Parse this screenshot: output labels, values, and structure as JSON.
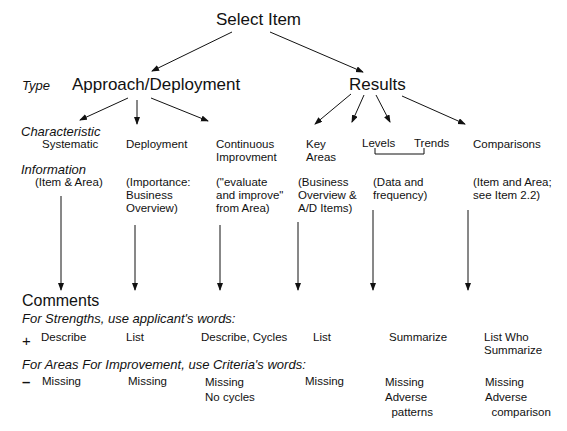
{
  "title": "Select Item",
  "labels": {
    "type": "Type",
    "characteristic": "Characteristic",
    "information": "Information",
    "comments": "Comments",
    "strengths_instruction": "For Strengths, use applicant's words:",
    "afi_instruction": "For Areas For Improvement, use Criteria's words:",
    "plus": "+",
    "minus": "–"
  },
  "types": {
    "approach": "Approach/Deployment",
    "results": "Results"
  },
  "columns": [
    {
      "characteristic": "Systematic",
      "information": "(Item & Area)",
      "strength": "Describe",
      "afi": "Missing"
    },
    {
      "characteristic": "Deployment",
      "information": "(Importance:\nBusiness\nOverview)",
      "strength": "List",
      "afi": "Missing"
    },
    {
      "characteristic": "Continuous\nImprovment",
      "information": "(\"evaluate\nand improve\"\nfrom Area)",
      "strength": "Describe, Cycles",
      "afi": "Missing\nNo cycles"
    },
    {
      "characteristic": "Key\nAreas",
      "information": "(Business\nOverview &\nA/D Items)",
      "strength": "List",
      "afi": "Missing"
    },
    {
      "characteristic_a": "Levels",
      "characteristic_b": "Trends",
      "information": "(Data and\nfrequency)",
      "strength": "Summarize",
      "afi": "Missing\nAdverse\n  patterns"
    },
    {
      "characteristic": "Comparisons",
      "information": "(Item and Area;\nsee Item 2.2)",
      "strength": "List Who\nSummarize",
      "afi": "Missing\nAdverse\n  comparison"
    }
  ],
  "colors": {
    "ink": "#111111",
    "background": "#ffffff"
  }
}
